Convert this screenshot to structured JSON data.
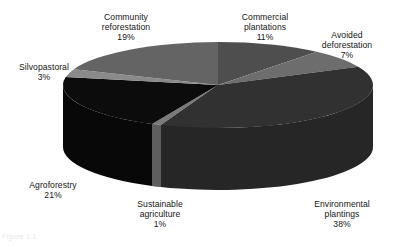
{
  "chart_data": {
    "type": "pie",
    "title": "",
    "subtitle": "",
    "xlabel": "",
    "ylabel": "",
    "legend_position": "labels-around-chart",
    "grid": false,
    "three_d": true,
    "start_angle_deg": 0,
    "direction": "clockwise",
    "units": "percent",
    "categories": [
      "Commercial plantations",
      "Avoided deforestation",
      "Environmental plantings",
      "Sustainable agriculture",
      "Agroforestry",
      "Silvopastoral",
      "Community reforestation"
    ],
    "values": [
      11,
      7,
      38,
      1,
      21,
      3,
      19
    ],
    "slices": [
      {
        "name": "Commercial plantations",
        "label_line1": "Commercial",
        "label_line2": "plantations",
        "value": 11,
        "pct_text": "11%",
        "color": "#4e4e4e",
        "side_color": "#3b3b3b"
      },
      {
        "name": "Avoided deforestation",
        "label_line1": "Avoided",
        "label_line2": "deforestation",
        "value": 7,
        "pct_text": "7%",
        "color": "#6d6d6d",
        "side_color": "#515151"
      },
      {
        "name": "Environmental plantings",
        "label_line1": "Environmental",
        "label_line2": "plantings",
        "value": 38,
        "pct_text": "38%",
        "color": "#313131",
        "side_color": "#262626"
      },
      {
        "name": "Sustainable agriculture",
        "label_line1": "Sustainable",
        "label_line2": "agriculture",
        "value": 1,
        "pct_text": "1%",
        "color": "#7a7a7a",
        "side_color": "#5e5e5e"
      },
      {
        "name": "Agroforestry",
        "label_line1": "Agroforestry",
        "label_line2": "",
        "value": 21,
        "pct_text": "21%",
        "color": "#0c0c0c",
        "side_color": "#080808"
      },
      {
        "name": "Silvopastoral",
        "label_line1": "Silvopastoral",
        "label_line2": "",
        "value": 3,
        "pct_text": "3%",
        "color": "#8a8a8a",
        "side_color": "#6a6a6a"
      },
      {
        "name": "Community reforestation",
        "label_line1": "Community",
        "label_line2": "reforestation",
        "value": 19,
        "pct_text": "19%",
        "color": "#646464",
        "side_color": "#4c4c4c"
      }
    ],
    "total": 100
  },
  "labels": {
    "community": {
      "line1": "Community",
      "line2": "reforestation",
      "pct": "19%"
    },
    "commercial": {
      "line1": "Commercial",
      "line2": "plantations",
      "pct": "11%"
    },
    "avoided": {
      "line1": "Avoided",
      "line2": "deforestation",
      "pct": "7%"
    },
    "silvopastoral": {
      "line1": "Silvopastoral",
      "line2": "",
      "pct": "3%"
    },
    "agroforestry": {
      "line1": "Agroforestry",
      "line2": "",
      "pct": "21%"
    },
    "sustainable": {
      "line1": "Sustainable",
      "line2": "agriculture",
      "pct": "1%"
    },
    "environmental": {
      "line1": "Environmental",
      "line2": "plantings",
      "pct": "38%"
    }
  },
  "page": {
    "background": "#ffffff",
    "text_color": "#161616",
    "caption_artifact": "Figure 1.1"
  }
}
